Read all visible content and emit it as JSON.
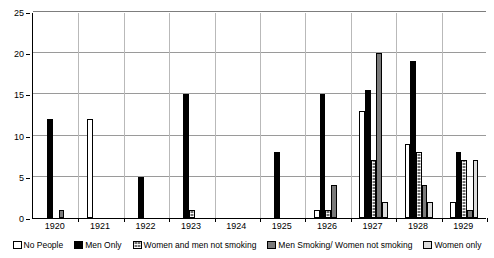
{
  "chart_data": {
    "type": "bar",
    "title": "",
    "subtitle": "",
    "xlabel": "",
    "ylabel": "",
    "ylim": [
      0,
      25
    ],
    "yticks": [
      0,
      5,
      10,
      15,
      20,
      25
    ],
    "grid": true,
    "legend_position": "bottom",
    "categories": [
      "1920",
      "1921",
      "1922",
      "1923",
      "1924",
      "1925",
      "1926",
      "1927",
      "1928",
      "1929"
    ],
    "series": [
      {
        "name": "No People",
        "color": "#ffffff",
        "pattern": "solid-white",
        "values": [
          0,
          12,
          0,
          0,
          0,
          0,
          1,
          13,
          9,
          2
        ]
      },
      {
        "name": "Men Only",
        "color": "#000000",
        "pattern": "solid-black",
        "values": [
          12,
          0,
          5,
          15,
          0,
          8,
          15,
          15.5,
          19,
          8
        ]
      },
      {
        "name": "Women and men not smoking",
        "color": "#6e6e6e",
        "pattern": "cross-hatch",
        "values": [
          0,
          0,
          0,
          1,
          0,
          0,
          1,
          7,
          8,
          7
        ]
      },
      {
        "name": "Men Smoking/ Women not smoking",
        "color": "#7a7a7a",
        "pattern": "solid-gray",
        "values": [
          1,
          0,
          0,
          0,
          0,
          0,
          4,
          20,
          4,
          1
        ]
      },
      {
        "name": "Women only",
        "color": "#dcdcdc",
        "pattern": "solid-light-gray",
        "values": [
          0,
          0,
          0,
          0,
          0,
          0,
          0,
          2,
          2,
          7
        ]
      }
    ]
  }
}
